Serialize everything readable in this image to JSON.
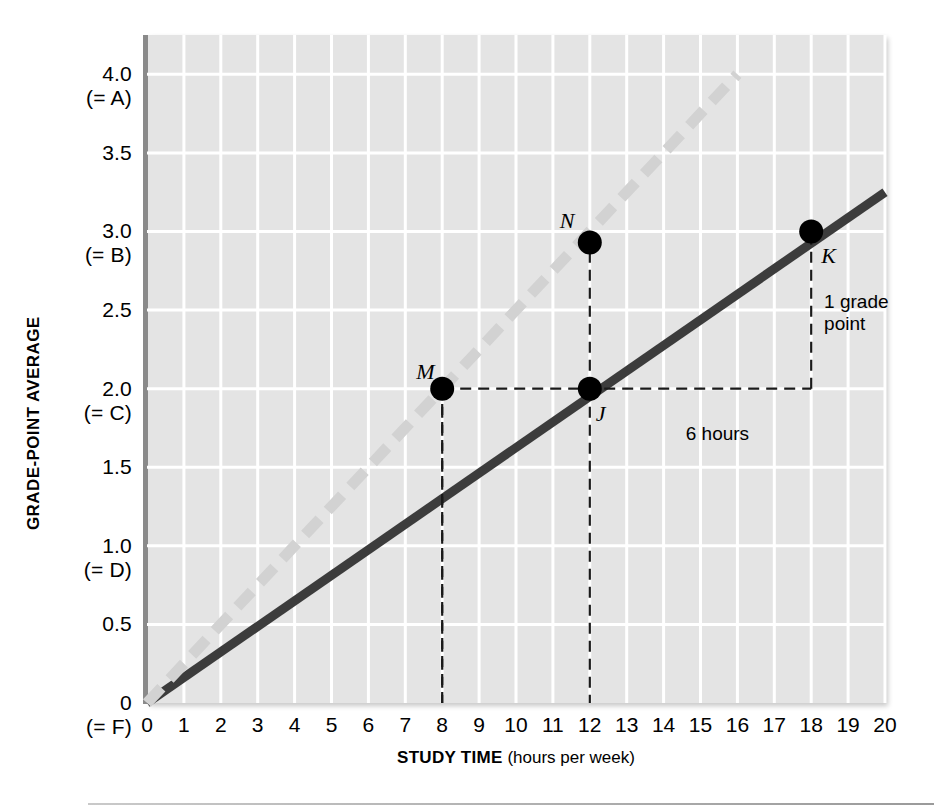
{
  "chart_data": {
    "type": "line",
    "title": "",
    "xlabel_bold": "STUDY TIME",
    "xlabel_rest": " (hours per week)",
    "ylabel": "GRADE-POINT AVERAGE",
    "xlim": [
      0,
      20
    ],
    "ylim": [
      0,
      4.25
    ],
    "grid": true,
    "legend": "none",
    "x_ticks": [
      "0",
      "1",
      "2",
      "3",
      "4",
      "5",
      "6",
      "7",
      "8",
      "9",
      "10",
      "11",
      "12",
      "13",
      "14",
      "15",
      "16",
      "17",
      "18",
      "19",
      "20"
    ],
    "x_tick_values": [
      0,
      1,
      2,
      3,
      4,
      5,
      6,
      7,
      8,
      9,
      10,
      11,
      12,
      13,
      14,
      15,
      16,
      17,
      18,
      19,
      20
    ],
    "y_ticks": [
      {
        "value": 4.0,
        "line1": "4.0",
        "line2": "(= A)"
      },
      {
        "value": 3.5,
        "line1": "3.5",
        "line2": ""
      },
      {
        "value": 3.0,
        "line1": "3.0",
        "line2": "(= B)"
      },
      {
        "value": 2.5,
        "line1": "2.5",
        "line2": ""
      },
      {
        "value": 2.0,
        "line1": "2.0",
        "line2": "(= C)"
      },
      {
        "value": 1.5,
        "line1": "1.5",
        "line2": ""
      },
      {
        "value": 1.0,
        "line1": "1.0",
        "line2": "(= D)"
      },
      {
        "value": 0.5,
        "line1": "0.5",
        "line2": ""
      },
      {
        "value": 0.0,
        "line1": "0",
        "line2": "(= F)"
      }
    ],
    "series": [
      {
        "name": "solid-line",
        "style": "solid",
        "color": "#3c3c3c",
        "x": [
          0,
          20
        ],
        "y": [
          0.0,
          3.25
        ]
      },
      {
        "name": "dashed-line",
        "style": "dashed",
        "color": "#d2d2d2",
        "x": [
          0,
          16
        ],
        "y": [
          0.0,
          4.0
        ]
      }
    ],
    "points": [
      {
        "label": "M",
        "x": 8,
        "y": 2.0,
        "label_dx": -26,
        "label_dy": -30
      },
      {
        "label": "N",
        "x": 12,
        "y": 2.93,
        "label_dx": -30,
        "label_dy": -34
      },
      {
        "label": "J",
        "x": 12,
        "y": 2.0,
        "label_dx": 6,
        "label_dy": 12
      },
      {
        "label": "K",
        "x": 18,
        "y": 3.0,
        "label_dx": 10,
        "label_dy": 12
      }
    ],
    "annotations": [
      {
        "name": "six-hours",
        "text": "6 hours",
        "x": 14.6,
        "y": 1.78
      },
      {
        "name": "one-grade-point",
        "text": "1 grade\npoint",
        "x": 18.35,
        "y": 2.62
      }
    ],
    "guides": {
      "horizontal_dashed_from_x": 8,
      "horizontal_dashed_to_x": 18,
      "horizontal_dashed_y": 2.0,
      "vertical_dashed": [
        {
          "x": 8,
          "y_from": 0.0,
          "y_to": 2.0
        },
        {
          "x": 12,
          "y_from": 2.0,
          "y_to": 2.93
        },
        {
          "x": 18,
          "y_from": 2.0,
          "y_to": 3.0
        }
      ]
    },
    "colors": {
      "plot_background": "#e4e4e4",
      "gridline": "#ffffff",
      "axis": "#8a8a8a",
      "solid_line": "#3c3c3c",
      "dashed_line": "#d2d2d2",
      "marker": "#000000"
    }
  }
}
